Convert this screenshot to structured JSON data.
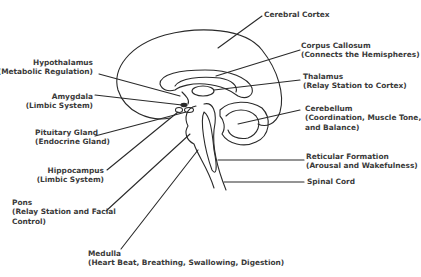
{
  "labels": {
    "cerebral_cortex": {
      "title": "Cerebral Cortex"
    },
    "corpus_callosum": {
      "title": "Corpus Callosum",
      "sub": "(Connects the Hemispheres)"
    },
    "thalamus": {
      "title": "Thalamus",
      "sub": "(Relay Station to Cortex)"
    },
    "cerebellum": {
      "title": "Cerebellum",
      "sub": "(Coordination, Muscle Tone,",
      "sub2": "and  Balance)"
    },
    "reticular_formation": {
      "title": "Reticular Formation",
      "sub": "(Arousal and Wakefulness)"
    },
    "spinal_cord": {
      "title": "Spinal Cord"
    },
    "hypothalamus": {
      "title": "Hypothalamus",
      "sub": "(Metabolic Regulation)"
    },
    "amygdala": {
      "title": "Amygdala",
      "sub": "(Limbic System)"
    },
    "pituitary_gland": {
      "title": "Pituitary Gland",
      "sub": "(Endocrine Gland)"
    },
    "hippocampus": {
      "title": "Hippocampus",
      "sub": "(Limbic System)"
    },
    "pons": {
      "title": "Pons",
      "sub": "(Relay Station and Facial",
      "sub2": "Control)"
    },
    "medulla": {
      "title": "Medulla",
      "sub": "(Heart Beat, Breathing, Swallowing, Digestion)"
    }
  },
  "colors": {
    "line": "#2a2a2a",
    "text": "#3a3a3a",
    "background": "#ffffff"
  }
}
